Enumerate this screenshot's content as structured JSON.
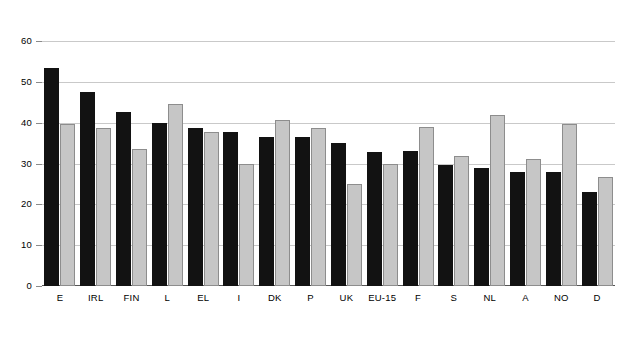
{
  "chart_data": {
    "type": "bar",
    "title": "",
    "xlabel": "",
    "ylabel": "",
    "ylim": [
      0,
      60
    ],
    "yticks": [
      0,
      10,
      20,
      30,
      40,
      50,
      60
    ],
    "grid": true,
    "legend": "none",
    "categories": [
      "E",
      "IRL",
      "FIN",
      "L",
      "EL",
      "I",
      "DK",
      "P",
      "UK",
      "EU-15",
      "F",
      "S",
      "NL",
      "A",
      "NO",
      "D"
    ],
    "series": [
      {
        "name": "dark",
        "color": "#121212",
        "values": [
          53.5,
          47.5,
          42.5,
          39.8,
          38.8,
          37.6,
          36.6,
          36.6,
          35.0,
          32.8,
          33.0,
          29.7,
          29.0,
          28.0,
          28.0,
          23.0
        ]
      },
      {
        "name": "light",
        "color": "#c6c6c6",
        "values": [
          39.7,
          38.8,
          33.6,
          44.6,
          37.8,
          29.8,
          40.7,
          38.8,
          25.0,
          29.9,
          38.9,
          31.9,
          41.9,
          31.1,
          39.7,
          26.8
        ]
      }
    ]
  },
  "axis": {
    "y_labels": [
      "60",
      "50",
      "40",
      "30",
      "20",
      "10",
      "0"
    ]
  }
}
